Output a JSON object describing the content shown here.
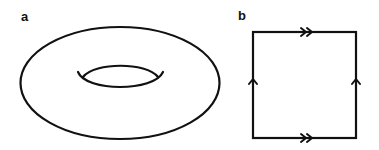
{
  "figure": {
    "panels": [
      {
        "label": "a",
        "content": "torus",
        "description": "Torus drawn as outer ellipse with inner hole"
      },
      {
        "label": "b",
        "content": "square-identification",
        "description": "Square with edge identifications: top and bottom edges marked with double arrows pointing right, left and right edges marked with single arrows pointing up"
      }
    ]
  },
  "colors": {
    "stroke": "#111111",
    "background": "#ffffff"
  },
  "icons": {
    "double_arrow": "double-chevron-right",
    "single_arrow": "chevron-up"
  }
}
